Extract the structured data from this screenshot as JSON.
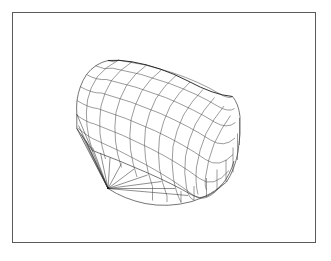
{
  "figure": {
    "type": "3d-wireframe-surface",
    "background_color": "#ffffff",
    "frame": {
      "x": 12,
      "y": 12,
      "width": 304,
      "height": 231,
      "border_color": "#5a5a5a",
      "border_width": 1
    },
    "title": "",
    "subtitle": "",
    "axis_labels": {
      "x": "",
      "y": "",
      "z": ""
    },
    "tick_labels": [],
    "legend": [],
    "annotations": []
  },
  "chart_data": {
    "type": "line",
    "title": "",
    "xlabel": "",
    "ylabel": "",
    "grid": true,
    "legend_position": "none",
    "projection": "isometric",
    "surface": {
      "mesh_rows": 8,
      "mesh_cols": 12,
      "radial_fan_lines": 12,
      "side_wall_verticals": 9
    },
    "apex": {
      "x": 108,
      "y": 188
    },
    "colors": {
      "mesh_stroke": "#4a4a4a",
      "radial_stroke": "#1e1e1e",
      "outline_stroke": "#3a3a3a",
      "ridge_stroke": "#1a1a1a",
      "background": "#ffffff"
    },
    "bounds": {
      "x": [
        76,
        240
      ],
      "y": [
        56,
        200
      ]
    },
    "series": [
      {
        "name": "dome-top-ridge",
        "x": [
          118,
          140,
          165,
          190,
          212,
          232
        ],
        "y": [
          60,
          64,
          70,
          78,
          87,
          96
        ]
      },
      {
        "name": "base-arc",
        "x": [
          108,
          135,
          165,
          195,
          220,
          238
        ],
        "y": [
          188,
          196,
          200,
          198,
          190,
          176
        ]
      },
      {
        "name": "left-silhouette",
        "x": [
          76,
          78,
          84,
          95,
          108
        ],
        "y": [
          105,
          92,
          78,
          66,
          60
        ]
      },
      {
        "name": "right-silhouette",
        "x": [
          232,
          238,
          240,
          238,
          232
        ],
        "y": [
          96,
          112,
          134,
          156,
          172
        ]
      }
    ]
  }
}
